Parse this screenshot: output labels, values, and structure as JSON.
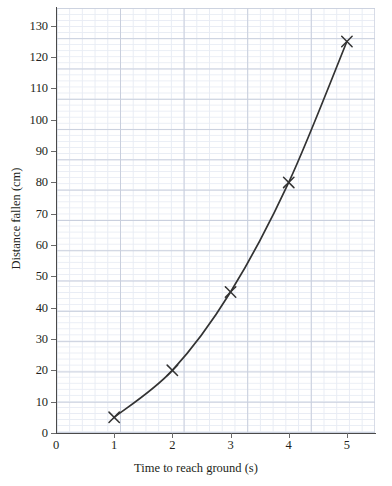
{
  "chart_data": {
    "type": "line",
    "title": "",
    "subtitle": "",
    "xlabel": "Time to reach ground (s)",
    "ylabel": "Distance fallen (cm)",
    "xlim": [
      0,
      5.5
    ],
    "ylim": [
      0,
      136
    ],
    "xticks": [
      "0",
      "1",
      "2",
      "3",
      "4",
      "5"
    ],
    "xtick_values": [
      0,
      1,
      2,
      3,
      4,
      5
    ],
    "yticks": [
      "0",
      "10",
      "20",
      "30",
      "40",
      "50",
      "60",
      "70",
      "80",
      "90",
      "100",
      "110",
      "120",
      "130"
    ],
    "ytick_values": [
      0,
      10,
      20,
      30,
      40,
      50,
      60,
      70,
      80,
      90,
      100,
      110,
      120,
      130
    ],
    "grid": true,
    "grid_minor": true,
    "legend": "none",
    "marker": "x-cross",
    "line_color": "#333333",
    "grid_color_major": "#c9cfdd",
    "grid_color_minor": "#e8ecf4",
    "axis_color": "#4a4a4a",
    "x": [
      1,
      2,
      3,
      4,
      5
    ],
    "values": [
      5,
      20,
      45,
      80,
      125
    ],
    "series": [
      {
        "name": "Distance fallen",
        "x": [
          1,
          2,
          3,
          4,
          5
        ],
        "values": [
          5,
          20,
          45,
          80,
          125
        ]
      }
    ],
    "points": [
      {
        "x": 1,
        "y": 5
      },
      {
        "x": 2,
        "y": 20
      },
      {
        "x": 3,
        "y": 45
      },
      {
        "x": 4,
        "y": 80
      },
      {
        "x": 5,
        "y": 125
      }
    ]
  }
}
